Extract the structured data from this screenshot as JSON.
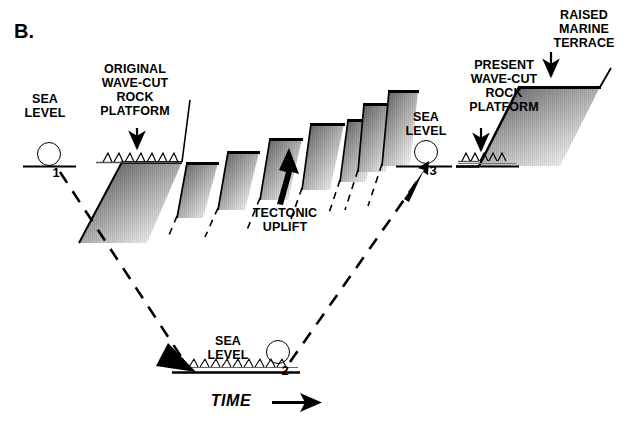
{
  "figure": {
    "panel_letter": "B.",
    "background_color": "#ffffff",
    "ink_color": "#000000",
    "border_color": "#b9b9b9"
  },
  "labels": {
    "sea_level": "SEA\nLEVEL",
    "original_platform": "ORIGINAL\nWAVE-CUT\nROCK\nPLATFORM",
    "tectonic_uplift": "TECTONIC\nUPLIFT",
    "present_platform": "PRESENT\nWAVE-CUT\nROCK\nPLATFORM",
    "raised_marine_terrace": "RAISED\nMARINE\nTERRACE",
    "time_axis": "TIME"
  },
  "stages": [
    {
      "id": "1",
      "marker": "1",
      "caption": "SEA\nLEVEL",
      "sea_level_x": [
        23,
        76
      ],
      "sea_level_y": 166
    },
    {
      "id": "2",
      "marker": "2",
      "caption": "SEA\nLEVEL",
      "sea_level_x": [
        172,
        300
      ],
      "sea_level_y": 372
    },
    {
      "id": "3",
      "marker": "3",
      "caption": "SEA\nLEVEL",
      "sea_level_x": [
        396,
        452
      ],
      "sea_level_y": 166
    }
  ],
  "terrace_staircase": {
    "step_count": 7,
    "direction": "ascending-left-to-right",
    "description": "Tectonically uplifted stepped wave-cut platforms"
  },
  "arrows": [
    {
      "name": "original-platform-pointer",
      "direction": "down"
    },
    {
      "name": "tectonic-uplift-arrow",
      "direction": "up"
    },
    {
      "name": "sea-level-3-pointer",
      "direction": "up-right"
    },
    {
      "name": "present-platform-pointer",
      "direction": "down"
    },
    {
      "name": "raised-terrace-pointer",
      "direction": "down"
    },
    {
      "name": "trajectory-to-stage-2",
      "direction": "down-right"
    },
    {
      "name": "trajectory-to-stage-3",
      "direction": "up-right"
    },
    {
      "name": "time-axis-arrow",
      "direction": "right"
    }
  ]
}
